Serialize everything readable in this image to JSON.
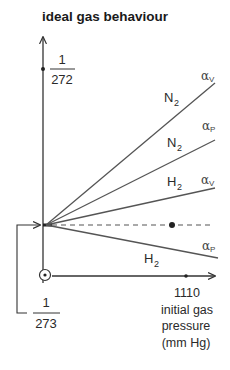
{
  "title": "ideal gas behaviour",
  "y_axis": {
    "upper_tick": {
      "numerator": "1",
      "denominator": "272"
    },
    "lower_tick": {
      "numerator": "1",
      "denominator": "273"
    }
  },
  "x_axis": {
    "tick_value": "1110",
    "label_line1": "initial gas",
    "label_line2": "pressure",
    "label_line3": "(mm Hg)"
  },
  "lines": [
    {
      "gas": "N",
      "gas_sub": "2",
      "coef": "α",
      "coef_sub": "V",
      "style": "solid"
    },
    {
      "gas": "N",
      "gas_sub": "2",
      "coef": "α",
      "coef_sub": "P",
      "style": "solid"
    },
    {
      "gas": "H",
      "gas_sub": "2",
      "coef": "α",
      "coef_sub": "V",
      "style": "solid"
    },
    {
      "gas": "",
      "gas_sub": "",
      "coef": "",
      "coef_sub": "",
      "style": "dashed",
      "meaning": "ideal gas"
    },
    {
      "gas": "H",
      "gas_sub": "2",
      "coef": "α",
      "coef_sub": "P",
      "style": "solid"
    }
  ],
  "colors": {
    "line": "#555555",
    "axis": "#333333",
    "text": "#222222"
  }
}
